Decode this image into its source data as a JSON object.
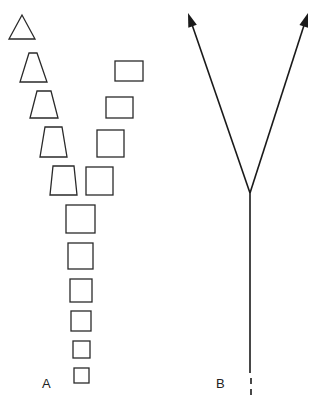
{
  "panels": {
    "a": {
      "label": "A",
      "triangle": {
        "points": "22,15 9,39 35,39"
      },
      "trapezoids": [
        {
          "points": "29,53 37,53 47,82 20,82"
        },
        {
          "points": "37,91 51,91 58,118 30,118"
        },
        {
          "points": "45,127 62,127 67,157 40,157"
        },
        {
          "points": "53,166 74,166 77,195 50,195"
        }
      ],
      "branch_squares": [
        {
          "x": 115,
          "y": 61,
          "w": 28,
          "h": 20
        },
        {
          "x": 106,
          "y": 97,
          "w": 27,
          "h": 21
        },
        {
          "x": 97,
          "y": 130,
          "w": 27,
          "h": 27
        },
        {
          "x": 86,
          "y": 167,
          "w": 27,
          "h": 28
        }
      ],
      "stem_squares": [
        {
          "x": 66,
          "y": 205,
          "w": 29,
          "h": 28
        },
        {
          "x": 68,
          "y": 243,
          "w": 25,
          "h": 26
        },
        {
          "x": 70,
          "y": 279,
          "w": 22,
          "h": 23
        },
        {
          "x": 71,
          "y": 311,
          "w": 20,
          "h": 20
        },
        {
          "x": 73,
          "y": 341,
          "w": 17,
          "h": 17
        },
        {
          "x": 74,
          "y": 368,
          "w": 15,
          "h": 15
        }
      ]
    },
    "b": {
      "label": "B",
      "fork": {
        "x": 250,
        "y": 193
      },
      "left_tip": {
        "x": 188,
        "y": 13
      },
      "right_tip": {
        "x": 308,
        "y": 13
      },
      "stem_end_y": 373,
      "dashes": [
        {
          "y1": 378,
          "y2": 384
        },
        {
          "y1": 389,
          "y2": 395
        }
      ]
    }
  }
}
